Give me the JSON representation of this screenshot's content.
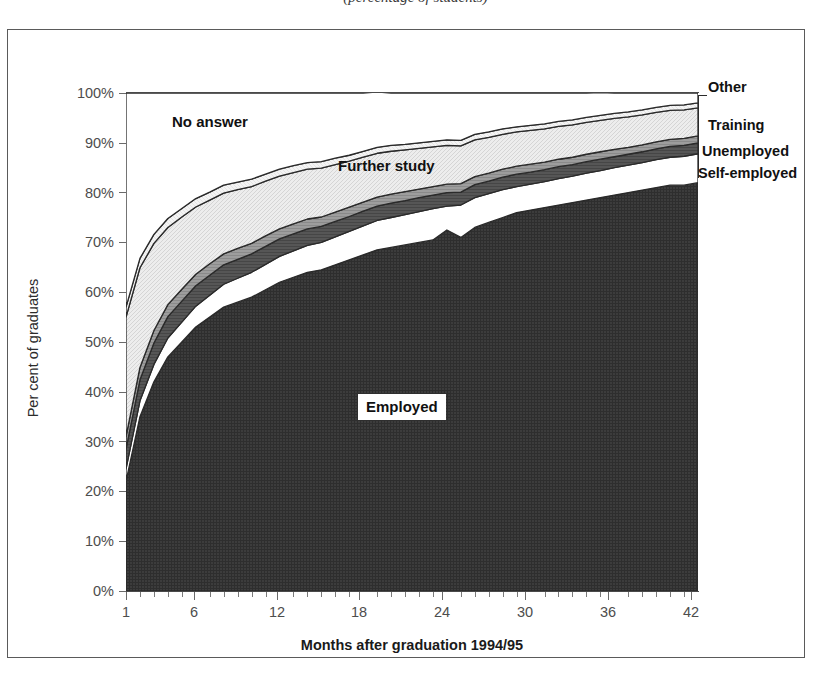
{
  "caption": "(percentage of students)",
  "chart_data": {
    "type": "area",
    "stacked": true,
    "title": "",
    "subtitle": "",
    "xlabel": "Months after graduation 1994/95",
    "ylabel": "Per cent of graduates",
    "xlim": [
      1,
      42
    ],
    "ylim": [
      0,
      100
    ],
    "grid": false,
    "legend_position": "inline-annotations",
    "xticks_major": [
      1,
      6,
      12,
      18,
      24,
      30,
      36,
      42
    ],
    "xtick_labels": [
      "1",
      "6",
      "12",
      "18",
      "24",
      "30",
      "36",
      "42"
    ],
    "yticks": [
      0,
      10,
      20,
      30,
      40,
      50,
      60,
      70,
      80,
      90,
      100
    ],
    "ytick_labels": [
      "0%",
      "10%",
      "20%",
      "30%",
      "40%",
      "50%",
      "60%",
      "70%",
      "80%",
      "90%",
      "100%"
    ],
    "x": [
      1,
      2,
      3,
      4,
      5,
      6,
      7,
      8,
      9,
      10,
      11,
      12,
      13,
      14,
      15,
      16,
      17,
      18,
      19,
      20,
      21,
      22,
      23,
      24,
      25,
      26,
      27,
      28,
      29,
      30,
      31,
      32,
      33,
      34,
      35,
      36,
      37,
      38,
      39,
      40,
      41,
      42
    ],
    "series": [
      {
        "name": "Employed",
        "fill": "#3a3a3a",
        "values": [
          22,
          35,
          42,
          47,
          50,
          53,
          55,
          57,
          58,
          59,
          60.5,
          62,
          63,
          64,
          64.5,
          65.5,
          66.5,
          67.5,
          68.5,
          69,
          69.5,
          70,
          70.5,
          72.5,
          71,
          73,
          74,
          75,
          76,
          76.5,
          77,
          77.5,
          78,
          78.5,
          79,
          79.5,
          80,
          80.5,
          81,
          81.5,
          81.5,
          82
        ]
      },
      {
        "name": "Self-employed",
        "fill": "#ffffff",
        "values": [
          2.5,
          3.2,
          3.5,
          3.8,
          4,
          4.2,
          4.4,
          4.6,
          4.8,
          5,
          5.1,
          5.2,
          5.3,
          5.4,
          5.5,
          5.6,
          5.7,
          5.8,
          5.9,
          6,
          6.1,
          6.2,
          6.3,
          4.8,
          6.5,
          6,
          5.8,
          5.6,
          5.2,
          5.2,
          5.2,
          5.3,
          5.3,
          5.4,
          5.4,
          5.5,
          5.5,
          5.5,
          5.6,
          5.6,
          5.8,
          5.8
        ]
      },
      {
        "name": "Unemployed",
        "fill": "#555555",
        "values": [
          4,
          4.2,
          4.3,
          4.3,
          4.2,
          4.1,
          4,
          3.9,
          3.8,
          3.7,
          3.6,
          3.5,
          3.4,
          3.3,
          3.2,
          3.1,
          3,
          3,
          2.9,
          2.9,
          2.8,
          2.8,
          2.7,
          2.7,
          2.6,
          2.6,
          2.5,
          2.5,
          2.5,
          2.4,
          2.4,
          2.4,
          2.3,
          2.3,
          2.3,
          2.2,
          2.2,
          2.2,
          2.2,
          2.2,
          2.2,
          2.2
        ]
      },
      {
        "name": "Training",
        "fill": "#9a9a9a",
        "values": [
          2.5,
          2.5,
          2.5,
          2.4,
          2.4,
          2.3,
          2.3,
          2.2,
          2.2,
          2.1,
          2.1,
          2,
          2,
          2,
          1.9,
          1.9,
          1.9,
          1.8,
          1.8,
          1.8,
          1.8,
          1.7,
          1.7,
          1.7,
          1.7,
          1.6,
          1.6,
          1.6,
          1.6,
          1.6,
          1.5,
          1.5,
          1.5,
          1.5,
          1.5,
          1.5,
          1.4,
          1.4,
          1.4,
          1.4,
          1.4,
          1.4
        ]
      },
      {
        "name": "Further study",
        "fill": "#e4e4e4",
        "values": [
          24,
          20,
          17.5,
          15.5,
          14.5,
          13.5,
          12.8,
          12.2,
          11.8,
          11.4,
          11,
          10.6,
          10.3,
          10,
          9.8,
          9.5,
          9.2,
          9,
          8.8,
          8.6,
          8.4,
          8.2,
          8,
          7.8,
          7.6,
          7.4,
          7.2,
          7,
          6.9,
          6.8,
          6.7,
          6.6,
          6.5,
          6.4,
          6.3,
          6.2,
          6.1,
          6,
          5.9,
          5.8,
          5.7,
          5.6
        ]
      },
      {
        "name": "Other",
        "fill": "#f2f2f2",
        "values": [
          2,
          1.9,
          1.8,
          1.8,
          1.7,
          1.7,
          1.6,
          1.6,
          1.5,
          1.5,
          1.4,
          1.4,
          1.4,
          1.3,
          1.3,
          1.3,
          1.2,
          1.2,
          1.2,
          1.2,
          1.1,
          1.1,
          1.1,
          1.1,
          1.1,
          1.1,
          1.1,
          1.1,
          1,
          1,
          1,
          1,
          1,
          1,
          1,
          1,
          1,
          1,
          1,
          1,
          1,
          1
        ]
      },
      {
        "name": "No answer",
        "fill": "#ffffff",
        "values": [
          43,
          33.2,
          28.4,
          25.2,
          23.2,
          21.2,
          19.9,
          18.5,
          17.9,
          17.3,
          16.3,
          15.3,
          14.6,
          14,
          13.8,
          13.1,
          12.5,
          11.7,
          11.1,
          10.5,
          10.3,
          10,
          9.7,
          9.4,
          9.5,
          8.3,
          7.8,
          7.2,
          6.8,
          6.5,
          6.2,
          5.7,
          5.4,
          4.9,
          4.6,
          4.1,
          3.8,
          3.4,
          2.9,
          2.5,
          2.4,
          2
        ]
      }
    ],
    "inline_annotations": [
      {
        "label": "No answer",
        "x": 7,
        "y": 95
      },
      {
        "label": "Further study",
        "x": 17,
        "y": 87
      },
      {
        "label": "Employed",
        "x": 21,
        "y": 40
      }
    ],
    "side_annotations": [
      {
        "label": "Other"
      },
      {
        "label": "Training"
      },
      {
        "label": "Unemployed"
      },
      {
        "label": "Self-employed"
      }
    ]
  }
}
